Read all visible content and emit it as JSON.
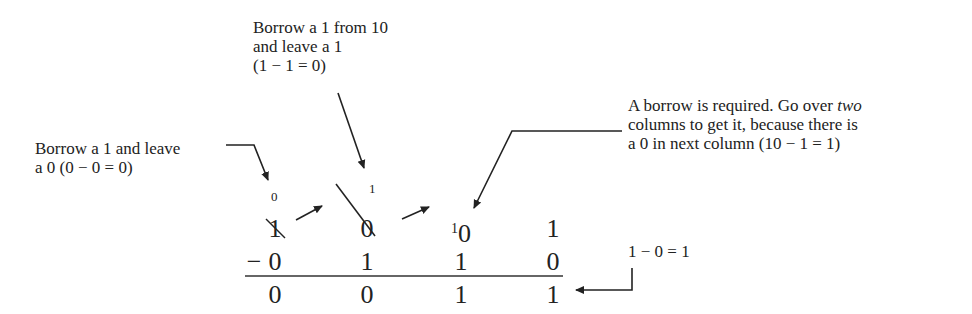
{
  "annotations": {
    "top": {
      "lines": [
        "Borrow a 1 from 10",
        "and leave a 1",
        "(1 − 1 = 0)"
      ]
    },
    "left": {
      "lines": [
        "Borrow a 1 and leave",
        "a 0 (0 − 0 = 0)"
      ]
    },
    "right": {
      "line1_prefix": "A borrow is required. Go over ",
      "line1_italic": "two",
      "line2": "columns to get it, because there is",
      "line3": "a 0 in next column (10 − 1 = 1)"
    },
    "bottom_right": {
      "text": "1 − 0 = 1"
    }
  },
  "subtraction": {
    "borrow_marks": {
      "col1": "0",
      "col2": "1",
      "col3_superscript": "1"
    },
    "minuend": [
      "1",
      "0",
      "0",
      "1"
    ],
    "subtrahend_sign": "−",
    "subtrahend": [
      "0",
      "1",
      "1",
      "0"
    ],
    "result": [
      "0",
      "0",
      "1",
      "1"
    ],
    "struck_columns": [
      0,
      1
    ]
  }
}
